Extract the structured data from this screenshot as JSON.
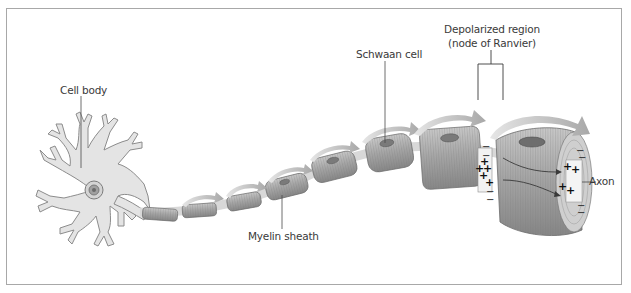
{
  "diagram": {
    "labels": {
      "cell_body": "Cell body",
      "schwann_cell": "Schwaan cell",
      "depolarized_region_line1": "Depolarized region",
      "depolarized_region_line2": "(node of Ranvier)",
      "myelin_sheath": "Myelin sheath",
      "axon": "Axon"
    },
    "charges": {
      "positive": "+",
      "negative": "−"
    },
    "colors": {
      "line": "#4a4a4a",
      "cell_fill": "#e4e4e4",
      "cell_stroke": "#8c8c8c",
      "sheath_fill": "#a9a9a9",
      "sheath_dark": "#8a8a8a",
      "node_fill": "#f2f2f2",
      "arrow": "#bdbdbd",
      "border": "#a8a8a8"
    }
  }
}
